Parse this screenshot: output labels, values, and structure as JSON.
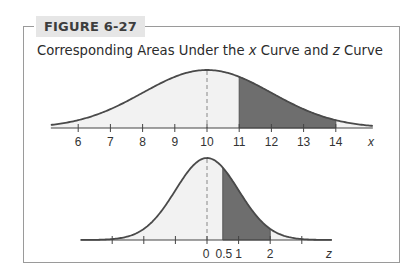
{
  "figure": {
    "label": "FIGURE 6-27",
    "title_parts": [
      "Corresponding Areas Under the ",
      "x",
      " Curve and ",
      "z",
      " Curve"
    ]
  },
  "colors": {
    "curve": "#4a4a4a",
    "shaded_fill": "#6e6e6e",
    "light_fill": "#f2f2f2",
    "frame": "#9a9a9a",
    "label_bg": "#e6e6e6"
  },
  "chart_data": [
    {
      "type": "area",
      "title": "x curve (normal distribution, mean 10)",
      "xlabel": "x",
      "ylabel": "",
      "x_ticks": [
        6,
        7,
        8,
        9,
        10,
        11,
        12,
        13,
        14
      ],
      "tick_labels": [
        "6",
        "7",
        "8",
        "9",
        "10",
        "11",
        "12",
        "13",
        "14"
      ],
      "mean": 10,
      "std": 2,
      "shaded_region": [
        11,
        14
      ],
      "mean_line": "dashed",
      "xlim": [
        4.7,
        15.2
      ]
    },
    {
      "type": "area",
      "title": "z curve (standard normal)",
      "xlabel": "z",
      "ylabel": "",
      "x_ticks": [
        -3,
        -2,
        -1,
        0,
        0.5,
        1,
        2,
        3
      ],
      "tick_labels": [
        "",
        "",
        "",
        "0",
        "0.5",
        "1",
        "2",
        ""
      ],
      "mean": 0,
      "std": 1,
      "shaded_region": [
        0.5,
        2
      ],
      "mean_line": "dashed",
      "xlim": [
        -4,
        4
      ]
    }
  ]
}
